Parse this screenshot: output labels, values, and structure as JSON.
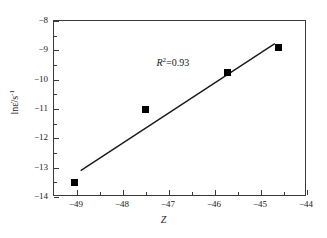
{
  "chart_data": {
    "type": "scatter",
    "title": "",
    "xlabel": "Z",
    "ylabel": "lnε̇/s",
    "ylabel_sup": "-1",
    "xlim": [
      -49.5,
      -44
    ],
    "ylim": [
      -14,
      -8
    ],
    "grid": false,
    "legend": null,
    "x": [
      -49.05,
      -47.52,
      -45.72,
      -44.62
    ],
    "y": [
      -13.52,
      -11.02,
      -9.77,
      -8.92
    ],
    "points": [
      {
        "x": -49.05,
        "y": -13.52
      },
      {
        "x": -47.52,
        "y": -11.02
      },
      {
        "x": -45.72,
        "y": -9.77
      },
      {
        "x": -44.62,
        "y": -8.92
      }
    ],
    "fit_line": {
      "x0": -48.92,
      "y0": -13.1,
      "x1": -44.7,
      "y1": -8.77
    },
    "annotations": [
      {
        "text_prefix": "R",
        "text_sup": "2",
        "text_suffix": "=0.93",
        "x": -47.25,
        "y": -9.48
      }
    ],
    "x_ticks_major": [
      -49,
      -48,
      -47,
      -46,
      -45,
      -44
    ],
    "x_ticks_major_labels": [
      "−49",
      "−48",
      "−47",
      "−46",
      "−45",
      "−44"
    ],
    "x_ticks_minor": [
      -49.5,
      -48.5,
      -47.5,
      -46.5,
      -45.5,
      -44.5
    ],
    "y_ticks_major": [
      -8,
      -9,
      -10,
      -11,
      -12,
      -13,
      -14
    ],
    "y_ticks_major_labels": [
      "−8",
      "−9",
      "−10",
      "−11",
      "−12",
      "−13",
      "−14"
    ],
    "y_ticks_minor": [
      -8.5,
      -9.5,
      -10.5,
      -11.5,
      -12.5,
      -13.5
    ],
    "colors": {
      "marker": "#000000",
      "line": "#1a1a1a",
      "axis": "#3a3a3a",
      "background": "#ffffff",
      "text": "#1a1a1a"
    }
  }
}
